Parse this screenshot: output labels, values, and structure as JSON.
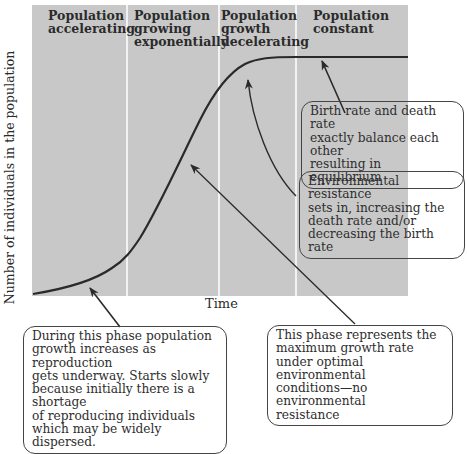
{
  "diagram": {
    "y_axis_label": "Number of individuals in the population",
    "x_axis_label": "Time",
    "colors": {
      "plot_background": "#c8c8c8",
      "divider": "#f2f2f2",
      "curve": "#2a2a2a",
      "page": "#ffffff"
    },
    "phases": [
      {
        "label": "Population accelerating"
      },
      {
        "label": "Population growing exponentially"
      },
      {
        "label": "Population growth decelerating"
      },
      {
        "label": "Population constant"
      }
    ],
    "phase_lines": [
      [
        "Population",
        "accelerating"
      ],
      [
        "Population",
        "growing",
        "exponentially"
      ],
      [
        "Population",
        "growth",
        "decelerating"
      ],
      [
        "Population",
        "constant"
      ]
    ],
    "callouts": [
      {
        "id": "equilibrium",
        "text": "Birth rate and death rate exactly balance each other resulting in equilibrium"
      },
      {
        "id": "resistance",
        "text": "Environmental resistance sets in, increasing the death rate and/or decreasing the birth rate"
      },
      {
        "id": "lag",
        "text": "During this phase population growth increases as reproduction gets underway. Starts slowly because initially there is a shortage of reproducing individuals which may be widely dispersed."
      },
      {
        "id": "exponential",
        "text": "This phase represents the maximum growth rate under optimal environmental conditions—no environmental resistance"
      }
    ],
    "callout_lines": {
      "equilibrium": [
        "Birth rate and death rate",
        "exactly balance each other",
        "resulting in equilibrium"
      ],
      "resistance": [
        "Environmental resistance",
        "sets in, increasing the",
        "death rate and/or",
        "decreasing the birth rate"
      ],
      "lag": [
        "During this phase population",
        "growth increases as reproduction",
        "gets underway. Starts slowly",
        "because initially there is a shortage",
        "of reproducing individuals",
        "which may be widely dispersed."
      ],
      "exponential": [
        "This phase represents the",
        "maximum growth rate",
        "under optimal environmental",
        "conditions—no environmental",
        "resistance"
      ]
    }
  }
}
